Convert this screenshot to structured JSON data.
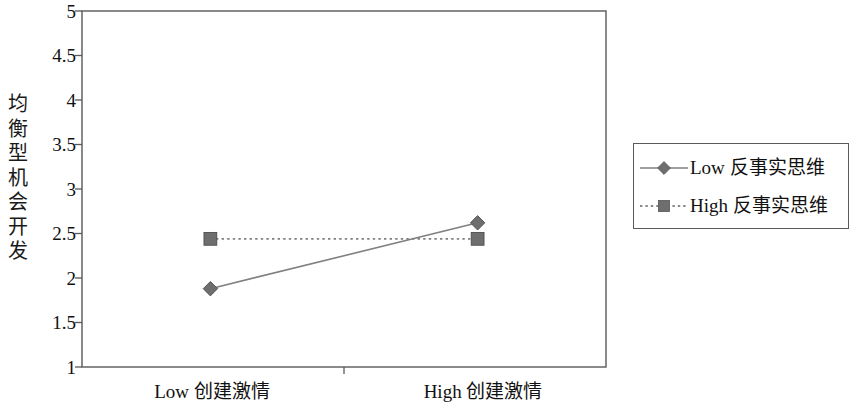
{
  "chart_data": {
    "type": "line",
    "title": "",
    "subtitle": "",
    "xlabel": "",
    "ylabel": "均衡型机会开发",
    "ylabel_chars": [
      "均",
      "衡",
      "型",
      "机",
      "会",
      "开",
      "发"
    ],
    "categories": [
      "Low 创建激情",
      "High 创建激情"
    ],
    "x_tick_labels": [
      "Low 创建激情",
      "High 创建激情"
    ],
    "y_tick_labels": [
      "5",
      "4.5",
      "4",
      "3.5",
      "3",
      "2.5",
      "2",
      "1.5",
      "1"
    ],
    "y_tick_values": [
      5,
      4.5,
      4,
      3.5,
      3,
      2.5,
      2,
      1.5,
      1
    ],
    "ylim": [
      1,
      5
    ],
    "grid": false,
    "legend_position": "right",
    "series": [
      {
        "name": "Low 反事实思维",
        "name_prefix": "Low",
        "name_cjk": "反事实思维",
        "values": [
          1.88,
          2.62
        ],
        "marker": "diamond",
        "linestyle": "solid",
        "color": "#808080"
      },
      {
        "name": "High 反事实思维",
        "name_prefix": "High",
        "name_cjk": "反事实思维",
        "values": [
          2.44,
          2.44
        ],
        "marker": "square",
        "linestyle": "dotted",
        "color": "#808080"
      }
    ],
    "axis_color": "#595959",
    "background_color": "#ffffff"
  },
  "legend": {
    "items": [
      {
        "label": "Low 反事实思维",
        "prefix": "Low",
        "cjk": "反事实思维"
      },
      {
        "label": "High 反事实思维",
        "prefix": "High",
        "cjk": "反事实思维"
      }
    ]
  }
}
